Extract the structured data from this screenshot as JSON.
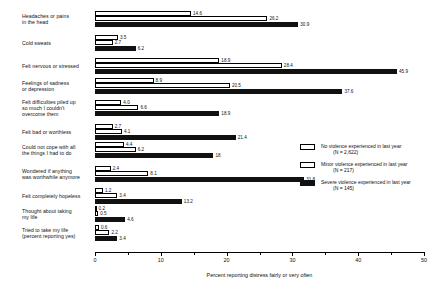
{
  "chart_data": {
    "type": "bar",
    "orientation": "horizontal",
    "title": "",
    "xlabel": "Percent reporting distress fairly or very often",
    "ylabel": "",
    "xlim": [
      0,
      50
    ],
    "xticks": [
      0,
      10,
      20,
      30,
      40,
      50
    ],
    "xticklabels": [
      "0",
      "10",
      "20",
      "30",
      "40",
      "50"
    ],
    "grid": false,
    "legend_position": "center-right",
    "categories": [
      "Headaches or pains in the head",
      "Cold sweats",
      "Felt nervous or stressed",
      "Feelings of sadness or depression",
      "Felt difficulties piled up so much I couldn't overcome them",
      "Felt bad or worthless",
      "Could not cope with all the things I had to do",
      "Wondered if anything was worthwhile anymore",
      "Felt completely hopeless",
      "Thought about taking my life",
      "Tried to take my life (percent reporting yes)"
    ],
    "series": [
      {
        "name": "No violence experienced in last year",
        "n_label": "(N = 2,622)",
        "color": "#ffffff",
        "edgecolor": "#000000",
        "values": [
          14.6,
          3.5,
          18.9,
          8.9,
          4.0,
          2.7,
          4.4,
          2.4,
          1.2,
          0.2,
          0.6
        ],
        "value_labels": [
          "14.6",
          "3.5",
          "18.9",
          "8.9",
          "4.0",
          "2.7",
          "4.4",
          "2.4",
          "1.2",
          "0.2",
          "0.6"
        ]
      },
      {
        "name": "Minor violence experienced in last year",
        "n_label": "(N = 217)",
        "color": "#ffffff",
        "edgecolor": "#000000",
        "values": [
          26.2,
          2.7,
          28.4,
          20.5,
          6.6,
          4.1,
          6.2,
          8.1,
          3.4,
          0.5,
          2.2
        ],
        "value_labels": [
          "26.2",
          "2.7",
          "28.4",
          "20.5",
          "6.6",
          "4.1",
          "6.2",
          "8.1",
          "3.4",
          "0.5",
          "2.2"
        ]
      },
      {
        "name": "Severe violence experienced in last year",
        "n_label": "(N = 145)",
        "color": "#111111",
        "edgecolor": "#111111",
        "values": [
          30.9,
          6.2,
          45.9,
          37.6,
          18.9,
          21.4,
          18.0,
          31.8,
          13.2,
          4.6,
          3.4
        ],
        "value_labels": [
          "30.9",
          "6.2",
          "45.9",
          "37.6",
          "18.9",
          "21.4",
          "18",
          "31.8",
          "13.2",
          "4.6",
          "3.4"
        ]
      }
    ]
  },
  "category_lines": [
    [
      "Headaches or pains",
      "in the head"
    ],
    [
      "Cold sweats"
    ],
    [
      "Felt nervous or stressed"
    ],
    [
      "Feelings of sadness",
      "or depression"
    ],
    [
      "Felt difficulties piled up",
      "so much I couldn't",
      "overcome them"
    ],
    [
      "Felt bad or worthless"
    ],
    [
      "Could not cope with all",
      "the things I had to do"
    ],
    [
      "Wondered if anything",
      "was worthwhile anymore"
    ],
    [
      "Felt completely hopeless"
    ],
    [
      "Thought about taking",
      "my life"
    ],
    [
      "Tried to take my life",
      "(percent reporting yes)"
    ]
  ]
}
